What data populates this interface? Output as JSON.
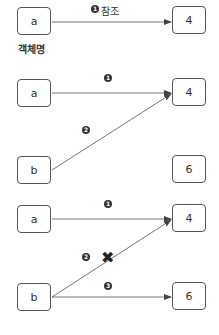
{
  "colors": {
    "stroke": "#555555",
    "text": "#333333",
    "badge": "#333333",
    "xmark": "#222222"
  },
  "section1": {
    "var_a": "a",
    "value_4": "4",
    "badge1": "1",
    "ref_label": "참조",
    "caption": "객체명"
  },
  "section2": {
    "var_a": "a",
    "var_b": "b",
    "value_4": "4",
    "value_6": "6",
    "badge1": "1",
    "badge2": "2"
  },
  "section3": {
    "var_a": "a",
    "var_b": "b",
    "value_4": "4",
    "value_6": "6",
    "badge1": "1",
    "badge2": "2",
    "badge3": "3",
    "xmark": "✖"
  }
}
